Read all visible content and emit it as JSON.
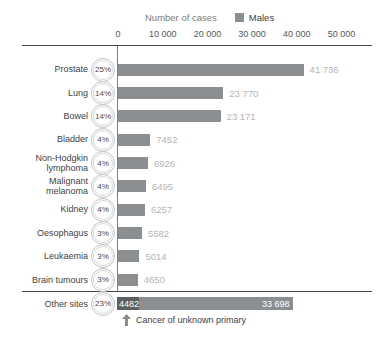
{
  "title": "Number of cases",
  "legend": {
    "label": "Males",
    "swatch_color": "#8c8f91"
  },
  "axis": {
    "tick_labels": [
      "0",
      "10 000",
      "20 000",
      "30 000",
      "40 000",
      "50 000"
    ],
    "tick_values": [
      0,
      10000,
      20000,
      30000,
      40000,
      50000
    ],
    "max": 50000
  },
  "chart_data": {
    "type": "bar",
    "orientation": "horizontal",
    "title": "Number of cases",
    "legend": [
      "Males"
    ],
    "legend_position": "top",
    "xlim": [
      0,
      50000
    ],
    "x_ticks": [
      0,
      10000,
      20000,
      30000,
      40000,
      50000
    ],
    "grid": false,
    "categories": [
      "Prostate",
      "Lung",
      "Bowel",
      "Bladder",
      "Non-Hodgkin lymphoma",
      "Malignant melanoma",
      "Kidney",
      "Oesophagus",
      "Leukaemia",
      "Brain tumours",
      "Other sites"
    ],
    "values": [
      41736,
      23770,
      23171,
      7452,
      6926,
      6495,
      6257,
      5582,
      5014,
      4650,
      38180
    ],
    "percent_labels": [
      "25%",
      "14%",
      "14%",
      "4%",
      "4%",
      "4%",
      "4%",
      "3%",
      "3%",
      "3%",
      "23%"
    ],
    "other_sites_breakdown": {
      "cancer_of_unknown_primary": 4482,
      "remainder": 33698
    },
    "annotation": "Cancer of unknown primary"
  },
  "rows": [
    {
      "label": "Prostate",
      "percent": "25%",
      "value": 41736,
      "value_label": "41 736"
    },
    {
      "label": "Lung",
      "percent": "14%",
      "value": 23770,
      "value_label": "23 770"
    },
    {
      "label": "Bowel",
      "percent": "14%",
      "value": 23171,
      "value_label": "23 171"
    },
    {
      "label": "Bladder",
      "percent": "4%",
      "value": 7452,
      "value_label": "7452"
    },
    {
      "label": "Non-Hodgkin\nlymphoma",
      "percent": "4%",
      "value": 6926,
      "value_label": "6926"
    },
    {
      "label": "Malignant\nmelanoma",
      "percent": "4%",
      "value": 6495,
      "value_label": "6495"
    },
    {
      "label": "Kidney",
      "percent": "4%",
      "value": 6257,
      "value_label": "6257"
    },
    {
      "label": "Oesophagus",
      "percent": "3%",
      "value": 5582,
      "value_label": "5582"
    },
    {
      "label": "Leukaemia",
      "percent": "3%",
      "value": 5014,
      "value_label": "5014"
    },
    {
      "label": "Brain tumours",
      "percent": "3%",
      "value": 4650,
      "value_label": "4650"
    }
  ],
  "other_row": {
    "label": "Other sites",
    "percent": "23%",
    "dark_value": 4482,
    "dark_label": "4482",
    "light_value": 33698,
    "light_label": "33 698"
  },
  "annotation": {
    "text": "Cancer of unknown primary"
  },
  "colors": {
    "bar": "#8c8f91",
    "bar_dark": "#5c5f61",
    "value_label": "#b3b5b7",
    "axis_line": "#45474a",
    "zero_line": "#7b7d7f",
    "circle_border": "#c0c2c4",
    "category_text": "#414345",
    "title_text": "#7a7c7e",
    "arrow": "#8a8c8e"
  }
}
